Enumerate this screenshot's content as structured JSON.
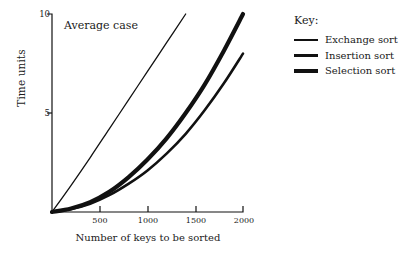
{
  "chart_data": {
    "type": "line",
    "title": "Average case",
    "xlabel": "Number of keys to be sorted",
    "ylabel": "Time units",
    "xlim": [
      0,
      2000
    ],
    "ylim": [
      0,
      10
    ],
    "xticks": [
      500,
      1000,
      1500,
      2000
    ],
    "xtick_labels": [
      "500",
      "1000",
      "1500",
      "2000"
    ],
    "yticks": [
      5,
      10
    ],
    "ytick_labels": [
      "5",
      "10"
    ],
    "grid": false,
    "legend_position": "right",
    "line_color": "#111111",
    "background": "#ffffff",
    "series": [
      {
        "name": "Exchange sort",
        "line_width": 1.3,
        "x": [
          0,
          200,
          400,
          600,
          800,
          1000,
          1200,
          1400
        ],
        "y": [
          0,
          1.35,
          2.75,
          4.2,
          5.65,
          7.1,
          8.55,
          10.0
        ]
      },
      {
        "name": "Insertion sort",
        "line_width": 2.6,
        "x": [
          0,
          200,
          400,
          600,
          800,
          1000,
          1200,
          1400,
          1600,
          1800,
          2000
        ],
        "y": [
          0,
          0.15,
          0.42,
          0.85,
          1.42,
          2.1,
          2.95,
          3.95,
          5.15,
          6.5,
          8.0
        ]
      },
      {
        "name": "Selection sort",
        "line_width": 4.2,
        "x": [
          0,
          200,
          400,
          600,
          800,
          1000,
          1200,
          1400,
          1600,
          1800,
          2000
        ],
        "y": [
          0,
          0.18,
          0.5,
          1.02,
          1.75,
          2.65,
          3.72,
          5.0,
          6.45,
          8.15,
          10.0
        ]
      }
    ]
  },
  "legend": {
    "title": "Key:",
    "entries": [
      {
        "label": "Exchange sort"
      },
      {
        "label": "Insertion sort"
      },
      {
        "label": "Selection sort"
      }
    ]
  },
  "axes": {
    "y_title": "Time units",
    "x_title": "Number of keys to be sorted",
    "y_tick_10": "10",
    "y_tick_5": "5",
    "x_tick_500": "500",
    "x_tick_1000": "1000",
    "x_tick_1500": "1500",
    "x_tick_2000": "2000"
  },
  "annotation": "Average case"
}
